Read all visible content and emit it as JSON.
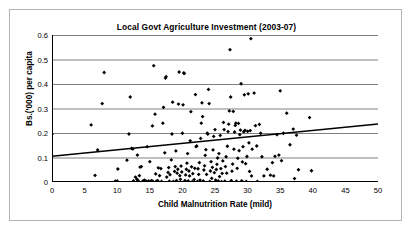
{
  "chart_data": {
    "type": "scatter",
    "title": "Local Govt Agriculture Investment (2003-07)",
    "xlabel": "Child Malnutrition Rate (mild)",
    "ylabel": "Bs.('000) per capita",
    "xlim": [
      0,
      50
    ],
    "ylim": [
      0,
      0.6
    ],
    "xticks": [
      "0",
      "5",
      "10",
      "15",
      "20",
      "25",
      "30",
      "35",
      "40",
      "45",
      "50"
    ],
    "yticks": [
      "0",
      "0.1",
      "0.2",
      "0.3",
      "0.4",
      "0.5",
      "0.6"
    ],
    "grid": "horizontal",
    "legend": "none",
    "marker_color": "#000000",
    "trendline_color": "#000000",
    "gridline_color": "#808080",
    "axis_color": "#000000",
    "trendline": {
      "type": "linear",
      "x0": 0,
      "y0": 0.105,
      "x1": 50,
      "y1": 0.237
    },
    "points": [
      [
        0.0,
        0.195
      ],
      [
        6.0,
        0.233
      ],
      [
        6.6,
        0.027
      ],
      [
        7.0,
        0.131
      ],
      [
        7.7,
        0.32
      ],
      [
        8.0,
        0.447
      ],
      [
        9.7,
        0.003
      ],
      [
        10.0,
        0.004
      ],
      [
        10.1,
        0.053
      ],
      [
        11.5,
        0.089
      ],
      [
        11.8,
        0.196
      ],
      [
        12.0,
        0.347
      ],
      [
        12.2,
        0.137
      ],
      [
        12.4,
        0.135
      ],
      [
        12.5,
        0.004
      ],
      [
        12.8,
        0.02
      ],
      [
        13.0,
        0.012
      ],
      [
        13.1,
        0.11
      ],
      [
        13.2,
        0.006
      ],
      [
        13.4,
        0.026
      ],
      [
        13.5,
        0.061
      ],
      [
        13.7,
        0.063
      ],
      [
        13.9,
        0.002
      ],
      [
        14.0,
        0.004
      ],
      [
        14.2,
        0.008
      ],
      [
        14.4,
        0.003
      ],
      [
        14.6,
        0.144
      ],
      [
        14.8,
        0.004
      ],
      [
        15.0,
        0.083
      ],
      [
        15.1,
        0.002
      ],
      [
        15.3,
        0.006
      ],
      [
        15.4,
        0.229
      ],
      [
        15.5,
        0.001
      ],
      [
        15.6,
        0.475
      ],
      [
        15.8,
        0.277
      ],
      [
        15.9,
        0.033
      ],
      [
        16.0,
        0.003
      ],
      [
        16.2,
        0.006
      ],
      [
        16.3,
        0.058
      ],
      [
        16.5,
        0.026
      ],
      [
        16.7,
        0.055
      ],
      [
        16.8,
        0.002
      ],
      [
        17.0,
        0.24
      ],
      [
        17.1,
        0.305
      ],
      [
        17.3,
        0.119
      ],
      [
        17.4,
        0.424
      ],
      [
        17.5,
        0.43
      ],
      [
        17.6,
        0.02
      ],
      [
        17.8,
        0.039
      ],
      [
        17.9,
        0.059
      ],
      [
        18.0,
        0.003
      ],
      [
        18.1,
        0.03
      ],
      [
        18.3,
        0.09
      ],
      [
        18.4,
        0.196
      ],
      [
        18.5,
        0.326
      ],
      [
        18.6,
        0.002
      ],
      [
        18.8,
        0.043
      ],
      [
        18.9,
        0.063
      ],
      [
        19.0,
        0.127
      ],
      [
        19.1,
        0.006
      ],
      [
        19.2,
        0.036
      ],
      [
        19.3,
        0.052
      ],
      [
        19.4,
        0.318
      ],
      [
        19.5,
        0.449
      ],
      [
        19.6,
        0.026
      ],
      [
        19.7,
        0.011
      ],
      [
        19.8,
        0.065
      ],
      [
        19.9,
        0.041
      ],
      [
        20.0,
        0.199
      ],
      [
        20.1,
        0.315
      ],
      [
        20.2,
        0.445
      ],
      [
        20.3,
        0.443
      ],
      [
        20.4,
        0.006
      ],
      [
        20.5,
        0.029
      ],
      [
        20.6,
        0.052
      ],
      [
        20.7,
        0.077
      ],
      [
        20.8,
        0.116
      ],
      [
        20.9,
        0.004
      ],
      [
        21.0,
        0.045
      ],
      [
        21.1,
        0.025
      ],
      [
        21.2,
        0.168
      ],
      [
        21.3,
        0.287
      ],
      [
        21.4,
        0.062
      ],
      [
        21.5,
        0.001
      ],
      [
        21.6,
        0.034
      ],
      [
        21.8,
        0.01
      ],
      [
        21.9,
        0.056
      ],
      [
        22.0,
        0.357
      ],
      [
        22.1,
        0.144
      ],
      [
        22.2,
        0.147
      ],
      [
        22.3,
        0.002
      ],
      [
        22.4,
        0.054
      ],
      [
        22.5,
        0.031
      ],
      [
        22.6,
        0.079
      ],
      [
        22.7,
        0.008
      ],
      [
        22.8,
        0.178
      ],
      [
        22.9,
        0.24
      ],
      [
        23.0,
        0.323
      ],
      [
        23.1,
        0.267
      ],
      [
        23.2,
        0.004
      ],
      [
        23.3,
        0.049
      ],
      [
        23.4,
        0.066
      ],
      [
        23.5,
        0.109
      ],
      [
        23.6,
        0.132
      ],
      [
        23.7,
        0.031
      ],
      [
        23.8,
        0.199
      ],
      [
        23.9,
        0.196
      ],
      [
        24.0,
        0.378
      ],
      [
        24.1,
        0.32
      ],
      [
        24.2,
        0.002
      ],
      [
        24.3,
        0.045
      ],
      [
        24.4,
        0.083
      ],
      [
        24.5,
        0.015
      ],
      [
        24.6,
        0.06
      ],
      [
        24.7,
        0.131
      ],
      [
        24.8,
        0.186
      ],
      [
        24.9,
        0.038
      ],
      [
        25.0,
        0.214
      ],
      [
        25.1,
        0.008
      ],
      [
        25.2,
        0.051
      ],
      [
        25.3,
        0.072
      ],
      [
        25.4,
        0.098
      ],
      [
        25.5,
        0.004
      ],
      [
        25.6,
        0.116
      ],
      [
        25.7,
        0.022
      ],
      [
        25.8,
        0.19
      ],
      [
        25.9,
        0.055
      ],
      [
        26.0,
        0.001
      ],
      [
        26.1,
        0.035
      ],
      [
        26.2,
        0.086
      ],
      [
        26.3,
        0.243
      ],
      [
        26.4,
        0.214
      ],
      [
        26.5,
        0.003
      ],
      [
        26.6,
        0.063
      ],
      [
        26.7,
        0.103
      ],
      [
        26.8,
        0.036
      ],
      [
        26.9,
        0.146
      ],
      [
        27.0,
        0.206
      ],
      [
        27.1,
        0.236
      ],
      [
        27.2,
        0.29
      ],
      [
        27.3,
        0.54
      ],
      [
        27.4,
        0.347
      ],
      [
        27.5,
        0.006
      ],
      [
        27.6,
        0.044
      ],
      [
        27.7,
        0.073
      ],
      [
        27.8,
        0.288
      ],
      [
        27.9,
        0.134
      ],
      [
        28.0,
        0.204
      ],
      [
        28.1,
        0.231
      ],
      [
        28.2,
        0.24
      ],
      [
        28.3,
        0.003
      ],
      [
        28.4,
        0.056
      ],
      [
        28.5,
        0.097
      ],
      [
        28.6,
        0.239
      ],
      [
        28.7,
        0.128
      ],
      [
        28.8,
        0.193
      ],
      [
        28.9,
        0.212
      ],
      [
        29.0,
        0.401
      ],
      [
        29.1,
        0.005
      ],
      [
        29.2,
        0.082
      ],
      [
        29.3,
        0.144
      ],
      [
        29.4,
        0.205
      ],
      [
        29.5,
        0.356
      ],
      [
        29.6,
        0.211
      ],
      [
        29.7,
        0.075
      ],
      [
        29.8,
        0.002
      ],
      [
        29.9,
        0.104
      ],
      [
        30.0,
        0.207
      ],
      [
        30.1,
        0.36
      ],
      [
        30.2,
        0.16
      ],
      [
        30.3,
        0.043
      ],
      [
        30.4,
        0.21
      ],
      [
        30.5,
        0.585
      ],
      [
        30.6,
        0.025
      ],
      [
        30.7,
        0.134
      ],
      [
        31.0,
        0.363
      ],
      [
        31.2,
        0.23
      ],
      [
        31.4,
        0.147
      ],
      [
        31.5,
        0.002
      ],
      [
        31.8,
        0.235
      ],
      [
        32.0,
        0.199
      ],
      [
        32.2,
        0.103
      ],
      [
        32.5,
        0.025
      ],
      [
        33.0,
        0.052
      ],
      [
        33.5,
        0.028
      ],
      [
        33.8,
        0.079
      ],
      [
        34.0,
        0.025
      ],
      [
        34.2,
        0.105
      ],
      [
        34.5,
        0.193
      ],
      [
        34.8,
        0.11
      ],
      [
        35.0,
        0.372
      ],
      [
        35.2,
        0.087
      ],
      [
        35.5,
        0.199
      ],
      [
        36.0,
        0.281
      ],
      [
        36.5,
        0.152
      ],
      [
        37.0,
        0.216
      ],
      [
        37.2,
        0.014
      ],
      [
        37.5,
        0.191
      ],
      [
        37.8,
        0.05
      ],
      [
        39.5,
        0.263
      ],
      [
        39.8,
        0.046
      ]
    ]
  }
}
